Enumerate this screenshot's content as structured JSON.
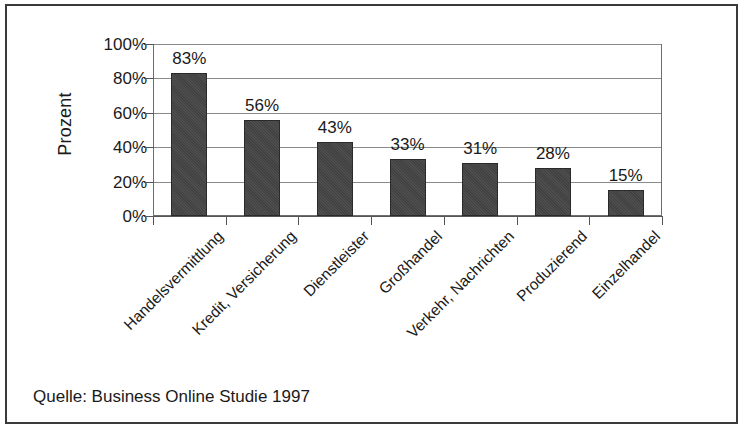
{
  "figure": {
    "source_caption": "Quelle: Business Online Studie 1997"
  },
  "chart_data": {
    "type": "bar",
    "title": "",
    "xlabel": "",
    "ylabel": "Prozent",
    "ylim": [
      0,
      100
    ],
    "ytick_labels": [
      "100%",
      "80%",
      "60%",
      "40%",
      "20%",
      "0%"
    ],
    "yticks": [
      100,
      80,
      60,
      40,
      20,
      0
    ],
    "grid": true,
    "legend": "none",
    "categories": [
      "Handelsvermittlung",
      "Kredit, Versicherung",
      "Dienstleister",
      "Großhandel",
      "Verkehr, Nachrichten",
      "Produzierend",
      "Einzelhandel"
    ],
    "values": [
      83,
      56,
      43,
      33,
      31,
      28,
      15
    ],
    "value_labels": [
      "83%",
      "56%",
      "43%",
      "33%",
      "31%",
      "28%",
      "15%"
    ],
    "bar_color": "#454545"
  }
}
